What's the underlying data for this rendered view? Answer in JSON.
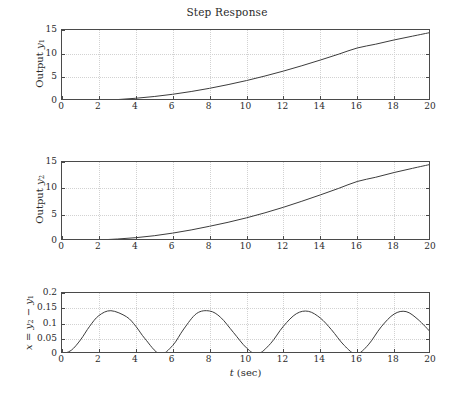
{
  "figure": {
    "title": "Step Response",
    "background": "#ffffff",
    "axis_color": "#4a4a4a",
    "grid_color": "#d2d2d2",
    "curve_color": "#3c3c3c"
  },
  "chart_data": [
    {
      "type": "line",
      "title": "Step Response",
      "panel": "top",
      "xlabel": "",
      "ylabel": "Output y₁",
      "ylabel_parts": {
        "prefix": "Output ",
        "symbol": "y",
        "subscript": "1"
      },
      "xlim": [
        0,
        20
      ],
      "ylim": [
        0,
        15
      ],
      "xticks": [
        0,
        2,
        4,
        6,
        8,
        10,
        12,
        14,
        16,
        18,
        20
      ],
      "yticks": [
        0,
        5,
        10,
        15
      ],
      "grid": true,
      "legend": null,
      "series": [
        {
          "name": "y1",
          "x": [
            0,
            1,
            2,
            3,
            4,
            5,
            6,
            7,
            8,
            9,
            10,
            11,
            12,
            13,
            14,
            15,
            16,
            17,
            18,
            19,
            20
          ],
          "y": [
            0.0,
            0.03,
            0.12,
            0.3,
            0.58,
            0.95,
            1.42,
            2.0,
            2.68,
            3.46,
            4.32,
            5.28,
            6.32,
            7.45,
            8.65,
            9.9,
            11.2,
            12.0,
            12.9,
            13.7,
            14.5
          ]
        }
      ]
    },
    {
      "type": "line",
      "title": "",
      "panel": "middle",
      "xlabel": "",
      "ylabel": "Output y₂",
      "ylabel_parts": {
        "prefix": "Output ",
        "symbol": "y",
        "subscript": "2"
      },
      "xlim": [
        0,
        20
      ],
      "ylim": [
        0,
        15
      ],
      "xticks": [
        0,
        2,
        4,
        6,
        8,
        10,
        12,
        14,
        16,
        18,
        20
      ],
      "yticks": [
        0,
        5,
        10,
        15
      ],
      "grid": true,
      "legend": null,
      "series": [
        {
          "name": "y2",
          "x": [
            0,
            1,
            2,
            3,
            4,
            5,
            6,
            7,
            8,
            9,
            10,
            11,
            12,
            13,
            14,
            15,
            16,
            17,
            18,
            19,
            20
          ],
          "y": [
            0.0,
            0.06,
            0.19,
            0.38,
            0.63,
            1.0,
            1.5,
            2.1,
            2.8,
            3.55,
            4.4,
            5.35,
            6.4,
            7.55,
            8.75,
            10.0,
            11.3,
            12.1,
            13.0,
            13.8,
            14.57
          ]
        }
      ]
    },
    {
      "type": "line",
      "title": "",
      "panel": "bottom",
      "xlabel": "t (sec)",
      "xlabel_parts": {
        "symbol": "t",
        "unit": " (sec)"
      },
      "ylabel": "x = y₂ − y₁",
      "ylabel_parts": {
        "symbol": "x",
        "equals": " = ",
        "term1": "y",
        "term1_sub": "2",
        "minus": " − ",
        "term2": "y",
        "term2_sub": "1"
      },
      "xlim": [
        0,
        20
      ],
      "ylim": [
        0,
        0.2
      ],
      "xticks": [
        0,
        2,
        4,
        6,
        8,
        10,
        12,
        14,
        16,
        18,
        20
      ],
      "yticks": [
        0,
        0.05,
        0.1,
        0.15,
        0.2
      ],
      "ytick_labels": [
        "0",
        "0.05",
        "0.1",
        "0.15",
        "0.2"
      ],
      "grid": true,
      "legend": null,
      "annotations": {
        "peak_value": 0.142,
        "period_sec": 5.3,
        "peak_times": [
          2.7,
          8.0,
          13.4,
          18.7
        ],
        "zero_times": [
          0,
          5.3,
          10.6,
          15.9
        ],
        "value_at_20": 0.07
      },
      "series": [
        {
          "name": "x = y2 - y1",
          "x": [
            0,
            0.5,
            1,
            1.5,
            2,
            2.65,
            3.5,
            4,
            4.5,
            5.3,
            6,
            6.6,
            7.3,
            8,
            8.6,
            9.3,
            10,
            10.6,
            11.3,
            12,
            12.7,
            13.35,
            14,
            14.6,
            15.3,
            15.95,
            16.6,
            17.3,
            18,
            18.65,
            19.3,
            20
          ],
          "y": [
            0.0,
            0.012,
            0.046,
            0.091,
            0.126,
            0.142,
            0.122,
            0.091,
            0.05,
            0.0,
            0.028,
            0.082,
            0.133,
            0.141,
            0.12,
            0.07,
            0.02,
            0.0,
            0.034,
            0.091,
            0.132,
            0.14,
            0.118,
            0.08,
            0.028,
            0.0,
            0.03,
            0.089,
            0.131,
            0.139,
            0.113,
            0.07
          ]
        }
      ]
    }
  ]
}
